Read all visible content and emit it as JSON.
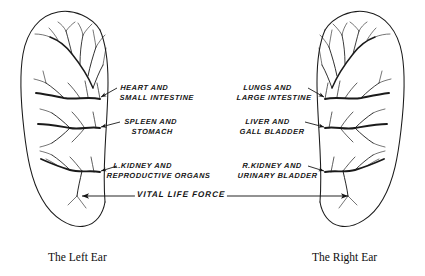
{
  "figure": {
    "background_color": "#ffffff",
    "ink_color": "#141414"
  },
  "captions": {
    "left_ear": "The Left Ear",
    "right_ear": "The Right Ear"
  },
  "axis": {
    "label": "VITAL LIFE FORCE",
    "style": "double-headed-arrow"
  },
  "left_ear_labels": [
    {
      "line1": "HEART AND",
      "line2": "SMALL INTESTINE"
    },
    {
      "line1": "SPLEEN AND",
      "line2": "STOMACH"
    },
    {
      "line1": "L.KIDNEY AND",
      "line2": "REPRODUCTIVE ORGANS"
    }
  ],
  "right_ear_labels": [
    {
      "line1": "LUNGS AND",
      "line2": "LARGE INTESTINE"
    },
    {
      "line1": "LIVER AND",
      "line2": "GALL BLADDER"
    },
    {
      "line1": "R.KIDNEY AND",
      "line2": "URINARY BLADDER"
    }
  ]
}
